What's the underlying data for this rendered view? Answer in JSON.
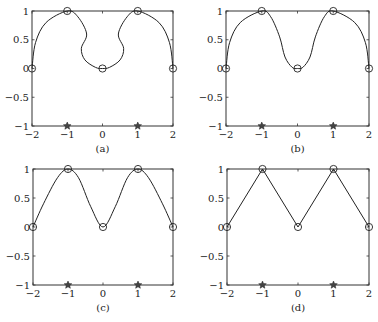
{
  "chart_data": [
    {
      "type": "line",
      "panel": "(a)",
      "caption": "(a)",
      "xlim": [
        -2,
        2
      ],
      "ylim": [
        -1,
        1
      ],
      "xticks": [
        -2,
        -1,
        0,
        1,
        2
      ],
      "yticks": [
        -1,
        -0.5,
        0,
        0.5,
        1
      ],
      "xtick_labels": [
        "−2",
        "−1",
        "0",
        "1",
        "2"
      ],
      "ytick_labels": [
        "−1",
        "−0.5",
        "0",
        "0.5",
        "1"
      ],
      "interpolation_nodes": {
        "marker": "circle",
        "x": [
          -2,
          -1,
          0,
          1,
          2
        ],
        "y": [
          0,
          1,
          0,
          1,
          0
        ]
      },
      "star_points": {
        "marker": "star",
        "x": [
          -1,
          1
        ],
        "y": [
          -1,
          -1
        ]
      },
      "curve_description": "smooth parametric curve through nodes with inward bulges near x=±0.5 (curve doubles back), semicircular arcs on outer segments",
      "curve": [
        [
          -2,
          0
        ],
        [
          -1.9,
          0.45
        ],
        [
          -1.6,
          0.8
        ],
        [
          -1,
          1
        ],
        [
          -0.7,
          0.9
        ],
        [
          -0.45,
          0.6
        ],
        [
          -0.6,
          0.35
        ],
        [
          -0.5,
          0.15
        ],
        [
          -0.2,
          0.02
        ],
        [
          0,
          0
        ],
        [
          0.2,
          0.02
        ],
        [
          0.5,
          0.15
        ],
        [
          0.6,
          0.35
        ],
        [
          0.45,
          0.6
        ],
        [
          0.7,
          0.9
        ],
        [
          1,
          1
        ],
        [
          1.6,
          0.8
        ],
        [
          1.9,
          0.45
        ],
        [
          2,
          0
        ]
      ],
      "grid": false,
      "legend": null
    },
    {
      "type": "line",
      "panel": "(b)",
      "caption": "(b)",
      "xlim": [
        -2,
        2
      ],
      "ylim": [
        -1,
        1
      ],
      "xticks": [
        -2,
        -1,
        0,
        1,
        2
      ],
      "yticks": [
        -1,
        -0.5,
        0,
        0.5,
        1
      ],
      "xtick_labels": [
        "−2",
        "−1",
        "0",
        "1",
        "2"
      ],
      "ytick_labels": [
        "−1",
        "−0.5",
        "0",
        "0.5",
        "1"
      ],
      "interpolation_nodes": {
        "marker": "circle",
        "x": [
          -2,
          -1,
          0,
          1,
          2
        ],
        "y": [
          0,
          1,
          0,
          1,
          0
        ]
      },
      "star_points": {
        "marker": "star",
        "x": [
          -1,
          1
        ],
        "y": [
          -1,
          -1
        ]
      },
      "curve_description": "smooth curve, steep S-shaped descent into central valley",
      "curve": [
        [
          -2,
          0
        ],
        [
          -1.9,
          0.45
        ],
        [
          -1.6,
          0.8
        ],
        [
          -1,
          1
        ],
        [
          -0.75,
          0.9
        ],
        [
          -0.5,
          0.55
        ],
        [
          -0.35,
          0.2
        ],
        [
          -0.15,
          0.02
        ],
        [
          0,
          0
        ],
        [
          0.15,
          0.02
        ],
        [
          0.35,
          0.2
        ],
        [
          0.5,
          0.55
        ],
        [
          0.75,
          0.9
        ],
        [
          1,
          1
        ],
        [
          1.6,
          0.8
        ],
        [
          1.9,
          0.45
        ],
        [
          2,
          0
        ]
      ],
      "grid": false,
      "legend": null
    },
    {
      "type": "line",
      "panel": "(c)",
      "caption": "(c)",
      "xlim": [
        -2,
        2
      ],
      "ylim": [
        -1,
        1
      ],
      "xticks": [
        -2,
        -1,
        0,
        1,
        2
      ],
      "yticks": [
        -1,
        -0.5,
        0,
        0.5,
        1
      ],
      "xtick_labels": [
        "−2",
        "−1",
        "0",
        "1",
        "2"
      ],
      "ytick_labels": [
        "−1",
        "−0.5",
        "0",
        "0.5",
        "1"
      ],
      "interpolation_nodes": {
        "marker": "circle",
        "x": [
          -2,
          -1,
          0,
          1,
          2
        ],
        "y": [
          0,
          1,
          0,
          1,
          0
        ]
      },
      "star_points": {
        "marker": "star",
        "x": [
          -1,
          1
        ],
        "y": [
          -1,
          -1
        ]
      },
      "curve_description": "smooth sinusoid-like wave through nodes",
      "curve": [
        [
          -2,
          0
        ],
        [
          -1.7,
          0.4
        ],
        [
          -1.3,
          0.85
        ],
        [
          -1,
          1
        ],
        [
          -0.7,
          0.85
        ],
        [
          -0.35,
          0.35
        ],
        [
          0,
          0
        ],
        [
          0.35,
          0.35
        ],
        [
          0.7,
          0.85
        ],
        [
          1,
          1
        ],
        [
          1.3,
          0.85
        ],
        [
          1.7,
          0.4
        ],
        [
          2,
          0
        ]
      ],
      "grid": false,
      "legend": null
    },
    {
      "type": "line",
      "panel": "(d)",
      "caption": "(d)",
      "xlim": [
        -2,
        2
      ],
      "ylim": [
        -1,
        1
      ],
      "xticks": [
        -2,
        -1,
        0,
        1,
        2
      ],
      "yticks": [
        -1,
        -0.5,
        0,
        0.5,
        1
      ],
      "xtick_labels": [
        "−2",
        "−1",
        "0",
        "1",
        "2"
      ],
      "ytick_labels": [
        "−1",
        "−0.5",
        "0",
        "0.5",
        "1"
      ],
      "interpolation_nodes": {
        "marker": "circle",
        "x": [
          -2,
          -1,
          0,
          1,
          2
        ],
        "y": [
          0,
          1,
          0,
          1,
          0
        ]
      },
      "star_points": {
        "marker": "star",
        "x": [
          -1,
          1
        ],
        "y": [
          -1,
          -1
        ]
      },
      "curve_description": "piecewise linear polyline through nodes",
      "curve": [
        [
          -2,
          0
        ],
        [
          -1,
          1
        ],
        [
          0,
          0
        ],
        [
          1,
          1
        ],
        [
          2,
          0
        ]
      ],
      "grid": false,
      "legend": null
    }
  ],
  "panels": [
    {
      "id": "a",
      "box": [
        32,
        11,
        173,
        126
      ],
      "caption": "(a)"
    },
    {
      "id": "b",
      "box": [
        226,
        11,
        369,
        126
      ],
      "caption": "(b)"
    },
    {
      "id": "c",
      "box": [
        33,
        169,
        173,
        285
      ],
      "caption": "(c)"
    },
    {
      "id": "d",
      "box": [
        227,
        169,
        369,
        285
      ],
      "caption": "(d)"
    }
  ],
  "colors": {
    "line": "#222222",
    "axis": "#333333",
    "background": "#ffffff"
  }
}
